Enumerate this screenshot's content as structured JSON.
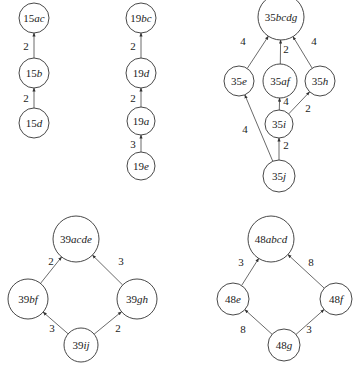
{
  "diagrams": [
    {
      "id": "d15",
      "nodes": [
        {
          "id": "15ac",
          "num": "15",
          "sub": "ac",
          "x": 34,
          "y": 18,
          "r": 15
        },
        {
          "id": "15b",
          "num": "15",
          "sub": "b",
          "x": 34,
          "y": 73,
          "r": 15
        },
        {
          "id": "15d",
          "num": "15",
          "sub": "d",
          "x": 34,
          "y": 123,
          "r": 15
        }
      ],
      "edges": [
        {
          "from": "15b",
          "to": "15ac",
          "weight": "2",
          "lx": 26,
          "ly": 46
        },
        {
          "from": "15d",
          "to": "15b",
          "weight": "2",
          "lx": 26,
          "ly": 98
        }
      ]
    },
    {
      "id": "d19",
      "nodes": [
        {
          "id": "19bc",
          "num": "19",
          "sub": "bc",
          "x": 141,
          "y": 18,
          "r": 15
        },
        {
          "id": "19d",
          "num": "19",
          "sub": "d",
          "x": 141,
          "y": 73,
          "r": 15
        },
        {
          "id": "19a",
          "num": "19",
          "sub": "a",
          "x": 141,
          "y": 121,
          "r": 14
        },
        {
          "id": "19e",
          "num": "19",
          "sub": "e",
          "x": 141,
          "y": 166,
          "r": 14
        }
      ],
      "edges": [
        {
          "from": "19d",
          "to": "19bc",
          "weight": "2",
          "lx": 133,
          "ly": 46
        },
        {
          "from": "19a",
          "to": "19d",
          "weight": "2",
          "lx": 133,
          "ly": 98
        },
        {
          "from": "19e",
          "to": "19a",
          "weight": "3",
          "lx": 133,
          "ly": 144
        }
      ]
    },
    {
      "id": "d35",
      "nodes": [
        {
          "id": "35bcdg",
          "num": "35",
          "sub": "bcdg",
          "x": 281,
          "y": 17,
          "r": 23
        },
        {
          "id": "35e",
          "num": "35",
          "sub": "e",
          "x": 239,
          "y": 81,
          "r": 15
        },
        {
          "id": "35af",
          "num": "35",
          "sub": "af",
          "x": 280,
          "y": 81,
          "r": 17
        },
        {
          "id": "35h",
          "num": "35",
          "sub": "h",
          "x": 320,
          "y": 81,
          "r": 15
        },
        {
          "id": "35i",
          "num": "35",
          "sub": "i",
          "x": 279,
          "y": 124,
          "r": 14
        },
        {
          "id": "35j",
          "num": "35",
          "sub": "j",
          "x": 279,
          "y": 176,
          "r": 16
        }
      ],
      "edges": [
        {
          "from": "35e",
          "to": "35bcdg",
          "weight": "4",
          "lx": 243,
          "ly": 41
        },
        {
          "from": "35af",
          "to": "35bcdg",
          "weight": "2",
          "lx": 286,
          "ly": 49
        },
        {
          "from": "35h",
          "to": "35bcdg",
          "weight": "4",
          "lx": 314,
          "ly": 41
        },
        {
          "from": "35i",
          "to": "35af",
          "weight": "4",
          "lx": 286,
          "ly": 101
        },
        {
          "from": "35i",
          "to": "35h",
          "weight": "2",
          "lx": 308,
          "ly": 108
        },
        {
          "from": "35j",
          "to": "35e",
          "weight": "4",
          "lx": 245,
          "ly": 129
        },
        {
          "from": "35j",
          "to": "35i",
          "weight": "2",
          "lx": 286,
          "ly": 145
        }
      ]
    },
    {
      "id": "d39",
      "nodes": [
        {
          "id": "39acde",
          "num": "39",
          "sub": "acde",
          "x": 76,
          "y": 239,
          "r": 23
        },
        {
          "id": "39bf",
          "num": "39",
          "sub": "bf",
          "x": 28,
          "y": 299,
          "r": 20
        },
        {
          "id": "39gh",
          "num": "39",
          "sub": "gh",
          "x": 137,
          "y": 299,
          "r": 20
        },
        {
          "id": "39ij",
          "num": "39",
          "sub": "ij",
          "x": 81,
          "y": 345,
          "r": 17
        }
      ],
      "edges": [
        {
          "from": "39bf",
          "to": "39acde",
          "weight": "2",
          "lx": 51,
          "ly": 261
        },
        {
          "from": "39gh",
          "to": "39acde",
          "weight": "3",
          "lx": 121,
          "ly": 261
        },
        {
          "from": "39ij",
          "to": "39bf",
          "weight": "3",
          "lx": 52,
          "ly": 328
        },
        {
          "from": "39ij",
          "to": "39gh",
          "weight": "2",
          "lx": 118,
          "ly": 328
        }
      ]
    },
    {
      "id": "d48",
      "nodes": [
        {
          "id": "48abcd",
          "num": "48",
          "sub": "abcd",
          "x": 271,
          "y": 239,
          "r": 23
        },
        {
          "id": "48e",
          "num": "48",
          "sub": "e",
          "x": 233,
          "y": 299,
          "r": 16
        },
        {
          "id": "48f",
          "num": "48",
          "sub": "f",
          "x": 336,
          "y": 299,
          "r": 16
        },
        {
          "id": "48g",
          "num": "48",
          "sub": "g",
          "x": 284,
          "y": 345,
          "r": 16
        }
      ],
      "edges": [
        {
          "from": "48e",
          "to": "48abcd",
          "weight": "3",
          "lx": 241,
          "ly": 262
        },
        {
          "from": "48f",
          "to": "48abcd",
          "weight": "8",
          "lx": 311,
          "ly": 262
        },
        {
          "from": "48g",
          "to": "48e",
          "weight": "8",
          "lx": 243,
          "ly": 329
        },
        {
          "from": "48g",
          "to": "48f",
          "weight": "3",
          "lx": 309,
          "ly": 329
        }
      ]
    }
  ]
}
